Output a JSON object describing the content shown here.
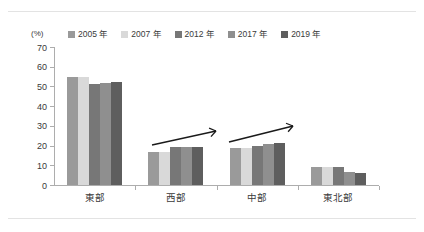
{
  "unit_label": "(%)",
  "legend": {
    "items": [
      {
        "label": "2005 年",
        "color": "#9a9a9a"
      },
      {
        "label": "2007 年",
        "color": "#d9d9d9"
      },
      {
        "label": "2012 年",
        "color": "#777777"
      },
      {
        "label": "2017 年",
        "color": "#8f8f8f"
      },
      {
        "label": "2019 年",
        "color": "#5e5e5e"
      }
    ]
  },
  "annotations": [
    {
      "name": "trend-arrow-west",
      "group": "西部",
      "direction": "up-right"
    },
    {
      "name": "trend-arrow-central",
      "group": "中部",
      "direction": "up-right"
    }
  ],
  "chart_data": {
    "type": "bar",
    "title": "",
    "xlabel": "",
    "ylabel": "(%)",
    "ylim": [
      0,
      70
    ],
    "yticks": [
      0,
      10,
      20,
      30,
      40,
      50,
      60,
      70
    ],
    "grid": false,
    "legend_position": "top",
    "categories": [
      "東部",
      "西部",
      "中部",
      "東北部"
    ],
    "series": [
      {
        "name": "2005 年",
        "color": "#9a9a9a",
        "values": [
          55.0,
          16.5,
          18.7,
          9.0
        ]
      },
      {
        "name": "2007 年",
        "color": "#d9d9d9",
        "values": [
          55.0,
          17.0,
          18.7,
          9.0
        ]
      },
      {
        "name": "2012 年",
        "color": "#777777",
        "values": [
          51.0,
          19.5,
          20.0,
          9.0
        ]
      },
      {
        "name": "2017 年",
        "color": "#8f8f8f",
        "values": [
          52.0,
          19.5,
          20.7,
          6.5
        ]
      },
      {
        "name": "2019 年",
        "color": "#5e5e5e",
        "values": [
          52.5,
          19.5,
          21.5,
          6.0
        ]
      }
    ]
  }
}
